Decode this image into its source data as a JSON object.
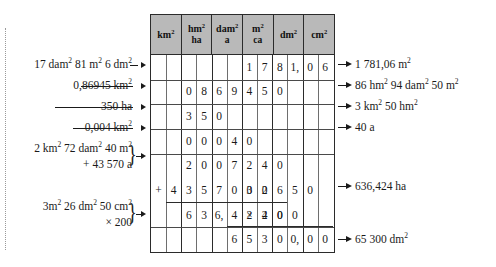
{
  "table": {
    "units": [
      {
        "main": "km",
        "exp": "2",
        "sub": ""
      },
      {
        "main": "hm",
        "exp": "2",
        "sub": "ha"
      },
      {
        "main": "dam",
        "exp": "2",
        "sub": "a"
      },
      {
        "main": "m",
        "exp": "2",
        "sub": "ca"
      },
      {
        "main": "dm",
        "exp": "2",
        "sub": ""
      },
      {
        "main": "cm",
        "exp": "2",
        "sub": ""
      }
    ],
    "column_count": 12,
    "row_count": 8,
    "rows": [
      {
        "id": "row-1",
        "cells": [
          "",
          "",
          "",
          "",
          "",
          "",
          "1",
          "7",
          "8",
          "1,",
          "0",
          "6"
        ],
        "op": ""
      },
      {
        "id": "row-2",
        "cells": [
          "",
          "",
          "0",
          "8",
          "6",
          "9",
          "4",
          "5",
          "0",
          "",
          "",
          ""
        ],
        "op": ""
      },
      {
        "id": "row-3",
        "cells": [
          "",
          "",
          "3",
          "5",
          "0",
          "",
          "",
          "",
          "",
          "",
          "",
          ""
        ],
        "op": ""
      },
      {
        "id": "row-4",
        "cells": [
          "",
          "",
          "0",
          "0",
          "0",
          "4",
          "0",
          "",
          "",
          "",
          "",
          ""
        ],
        "op": ""
      },
      {
        "id": "row-5",
        "cells": [
          "",
          "",
          "2",
          "0",
          "0",
          "7",
          "2",
          "4",
          "0",
          "",
          "",
          ""
        ],
        "op": ""
      },
      {
        "id": "row-6",
        "cells": [
          "",
          "4",
          "3",
          "5",
          "7",
          "0",
          "0",
          "0",
          "",
          "",
          "",
          ""
        ],
        "op": "+"
      },
      {
        "id": "row-7",
        "cells": [
          "",
          "",
          "6",
          "3",
          "6,",
          "4",
          "2",
          "4",
          "0",
          "",
          "",
          ""
        ],
        "op": ""
      },
      {
        "id": "row-8",
        "cells": [
          "",
          "",
          "",
          "",
          "",
          "",
          "3",
          "2",
          "6",
          "5",
          "0",
          ""
        ],
        "op": ""
      },
      {
        "id": "row-9",
        "cells": [
          "",
          "",
          "",
          "",
          "",
          "",
          "",
          "2",
          "0",
          "0",
          "",
          ""
        ],
        "op": "×"
      },
      {
        "id": "row-10",
        "cells": [
          "",
          "",
          "",
          "",
          "",
          "6",
          "5",
          "3",
          "0",
          "0,",
          "0",
          "0"
        ],
        "op": ""
      }
    ]
  },
  "left_labels": [
    {
      "id": "label-1",
      "lines": [
        [
          {
            "t": "17 dam"
          },
          {
            "t": "2",
            "sup": true
          },
          {
            "t": " 81 m"
          },
          {
            "t": "2",
            "sup": true
          },
          {
            "t": " 6 dm"
          },
          {
            "t": "2",
            "sup": true
          }
        ]
      ],
      "brace": false,
      "leader": false
    },
    {
      "id": "label-2",
      "lines": [
        [
          {
            "t": "0,86945 km"
          },
          {
            "t": "2",
            "sup": true
          }
        ]
      ],
      "brace": false,
      "leader": true
    },
    {
      "id": "label-3",
      "lines": [
        [
          {
            "t": "350 ha"
          }
        ]
      ],
      "brace": false,
      "leader": true
    },
    {
      "id": "label-4",
      "lines": [
        [
          {
            "t": "0,004 km"
          },
          {
            "t": "2",
            "sup": true
          }
        ]
      ],
      "brace": false,
      "leader": true
    },
    {
      "id": "label-5",
      "lines": [
        [
          {
            "t": "2 km"
          },
          {
            "t": "2",
            "sup": true
          },
          {
            "t": " 72 dam"
          },
          {
            "t": "2",
            "sup": true
          },
          {
            "t": " 40 m"
          },
          {
            "t": "2",
            "sup": true
          }
        ],
        [
          {
            "t": "+ 43 570 a"
          }
        ]
      ],
      "brace": true,
      "leader": false
    },
    {
      "id": "label-6",
      "lines": [
        [
          {
            "t": "3m"
          },
          {
            "t": "2",
            "sup": true
          },
          {
            "t": " 26 dm"
          },
          {
            "t": "2",
            "sup": true
          },
          {
            "t": " 50 cm"
          },
          {
            "t": "2",
            "sup": true
          }
        ],
        [
          {
            "t": "× 200"
          }
        ]
      ],
      "brace": true,
      "leader": false
    }
  ],
  "right_results": [
    {
      "id": "result-1",
      "parts": [
        {
          "t": "1 781,06 m"
        },
        {
          "t": "2",
          "sup": true
        }
      ]
    },
    {
      "id": "result-2",
      "parts": [
        {
          "t": "86 hm"
        },
        {
          "t": "2",
          "sup": true
        },
        {
          "t": " 94 dam"
        },
        {
          "t": "2",
          "sup": true
        },
        {
          "t": " 50 m"
        },
        {
          "t": "2",
          "sup": true
        }
      ]
    },
    {
      "id": "result-3",
      "parts": [
        {
          "t": "3 km"
        },
        {
          "t": "2",
          "sup": true
        },
        {
          "t": " 50 hm"
        },
        {
          "t": "2",
          "sup": true
        }
      ]
    },
    {
      "id": "result-4",
      "parts": [
        {
          "t": "40 a"
        }
      ]
    },
    {
      "id": "result-5",
      "parts": [
        {
          "t": "636,424 ha"
        }
      ]
    },
    {
      "id": "result-6",
      "parts": [
        {
          "t": "65 300 dm"
        },
        {
          "t": "2",
          "sup": true
        }
      ]
    }
  ],
  "colors": {
    "header_fill": "#b9b9b9",
    "grid_line": "#2b2b2b",
    "text": "#1a1a1a",
    "page": "#ffffff"
  }
}
